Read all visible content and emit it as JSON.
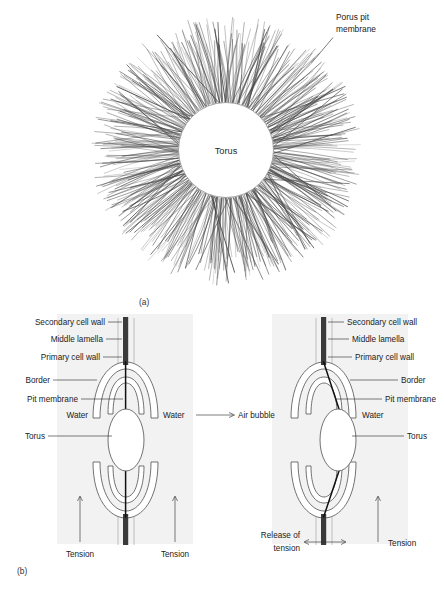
{
  "figure": {
    "panel_a": {
      "caption": "(a)",
      "torus_label": "Torus",
      "membrane_label_line1": "Porus pit",
      "membrane_label_line2": "membrane"
    },
    "panel_b": {
      "caption": "(b)",
      "transition_label": "Air bubble",
      "left": {
        "labels": [
          "Secondary cell wall",
          "Middle lamella",
          "Primary cell wall",
          "Border",
          "Pit membrane"
        ],
        "water_left": "Water",
        "water_right": "Water",
        "torus": "Torus",
        "tension_left": "Tension",
        "tension_right": "Tension"
      },
      "right": {
        "labels": [
          "Secondary cell wall",
          "Middle lamella",
          "Primary cell wall",
          "Border",
          "Pit membrane"
        ],
        "water": "Water",
        "torus": "Torus",
        "release_line1": "Release of",
        "release_line2": "tension",
        "tension_right": "Tension"
      }
    }
  },
  "colors": {
    "background": "#ffffff",
    "text": "#222222",
    "outline": "#5a5a5a",
    "wall": "#3a3a3a",
    "membrane": "#111111",
    "fiber": "#4a4a4a",
    "shade": "#f2f2f2"
  }
}
